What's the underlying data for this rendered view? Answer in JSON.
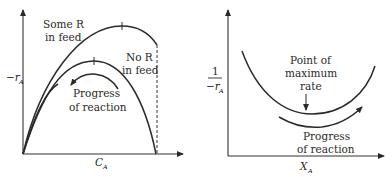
{
  "left_plot": {
    "y_axis_label": "−r",
    "y_axis_subscript": "A",
    "x_axis_label": "C",
    "x_axis_subscript": "A",
    "upper_curve_label_line1": "Some R",
    "upper_curve_label_line2": "in feed",
    "lower_curve_label_line1": "No R",
    "lower_curve_label_line2": "in feed",
    "arrow_label_line1": "Progress",
    "arrow_label_line2": "of reaction"
  },
  "right_plot": {
    "y_axis_label_numerator": "1",
    "y_axis_label_denominator": "−r",
    "y_axis_subscript": "A",
    "x_axis_label": "X",
    "x_axis_subscript": "A",
    "annotation_line1": "Point of",
    "annotation_line2": "maximum",
    "annotation_line3": "rate",
    "arrow_label_line1": "Progress",
    "arrow_label_line2": "of reaction"
  },
  "colors": {
    "line": "#2a2a2a",
    "background": "#ffffff"
  }
}
